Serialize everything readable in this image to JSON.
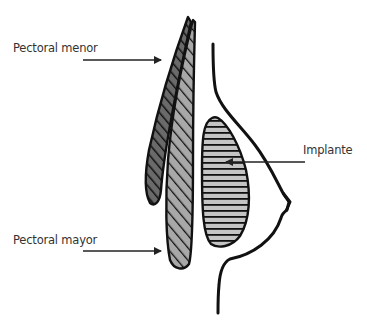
{
  "diagram": {
    "type": "anatomical-cross-section",
    "labels": {
      "pectoral_menor": "Pectoral menor",
      "implante": "Implante",
      "pectoral_mayor": "Pectoral mayor"
    },
    "colors": {
      "outline": "#111111",
      "pectoral_menor_fill": "#555555",
      "pectoral_mayor_fill": "#9a9a9a",
      "implant_fill": "#bdbdbd",
      "arrow": "#222222",
      "label_text": "#333333"
    }
  }
}
